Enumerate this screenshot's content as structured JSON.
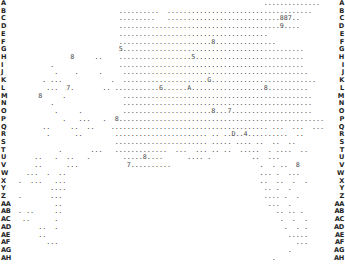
{
  "board": {
    "row_labels": [
      "A",
      "B",
      "C",
      "D",
      "E",
      "F",
      "G",
      "H",
      "I",
      "J",
      "K",
      "L",
      "M",
      "N",
      "O",
      "P",
      "Q",
      "R",
      "S",
      "T",
      "U",
      "V",
      "W",
      "X",
      "Y",
      "Z",
      "AA",
      "AB",
      "AC",
      "AD",
      "AE",
      "AF",
      "AG",
      "AH"
    ],
    "rows": [
      "                                                              ..............",
      "                          ..........  .................................... ",
      "                          .........   ............................887..    ",
      "                          ........................................9....     ",
      "                          .....................................             ",
      "                          .......................8...............         ",
      "                          5.............................................   ",
      "              8     ..    ..................5...........................   ",
      "         .                ..............................................   ",
      "          .    .     .     ..............................................   ",
      "       . ...            .  .....................G..........................",
      "        ...  7.       .. ...........6......A..................8..........  ",
      "      8     .              ............................................... ",
      "         .                 ...............................................  ",
      "          .     .          ......................8...7....................  ",
      "            .   ...   .  8...................................................",
      "       ..     ..  ..    ....................................... ...  ...  ...",
      "        .      ..        ....................... .. ..D..4..........  ..    ",
      "                         ....................... ..... .... ..  ..  ..      ",
      "           .       ...   .............  ...  ... .. ..  .....  . ....  ..   ",
      "     ..   .  ..   .        .....8....      .... .          ..  ...          ",
      "     ..      ...            7..........                      .  . ..  8     ",
      "   ...  .  ..                                                ... .  ...     ",
      " .  ...   ...                                                ..  ..  .  .   ",
      "         ....                                                 .. .  .       ",
      " .       ...                                                  .... .  .     ",
      "          ..                                                   ...  .       ",
      " . ..     ..                                                     .. .. .    ",
      "  ..      .                                                       .  .  .   ",
      "      ..  .                                                        .  . .   ",
      "      ..                                                            .....   ",
      "        ...                                                           ...   ",
      "                                                                    .       ",
      "                                                                .           "
    ]
  }
}
